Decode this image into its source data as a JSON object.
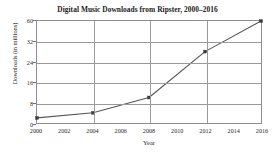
{
  "chart_data": {
    "type": "line",
    "title": "Digital Music Downloads from Ripster, 2000–2016",
    "xlabel": "Year",
    "ylabel": "Downloads (in millions)",
    "x": [
      2000,
      2004,
      2008,
      2012,
      2016
    ],
    "values": [
      2,
      4,
      10,
      28,
      40
    ],
    "series": [
      {
        "name": "Digital Music Downloads",
        "values": [
          2,
          4,
          10,
          28,
          40
        ]
      }
    ],
    "xlim": [
      2000,
      2016
    ],
    "ylim": [
      0,
      40
    ],
    "xticks": [
      2000,
      2002,
      2004,
      2006,
      2008,
      2010,
      2012,
      2014,
      2016
    ],
    "xticklabels": [
      "2000",
      "2002",
      "2004",
      "2006",
      "2008",
      "2010",
      "2012",
      "2014",
      "2016"
    ],
    "yticks": [
      0,
      8,
      16,
      24,
      32,
      40
    ],
    "yticklabels": [
      "0",
      "8",
      "16",
      "24",
      "32",
      "60"
    ],
    "grid": true,
    "legend": false,
    "line_color": "#555555",
    "marker_color": "#3a3a3a",
    "grid_color": "#9a9a9a",
    "axis_color": "#8d8d8d"
  }
}
